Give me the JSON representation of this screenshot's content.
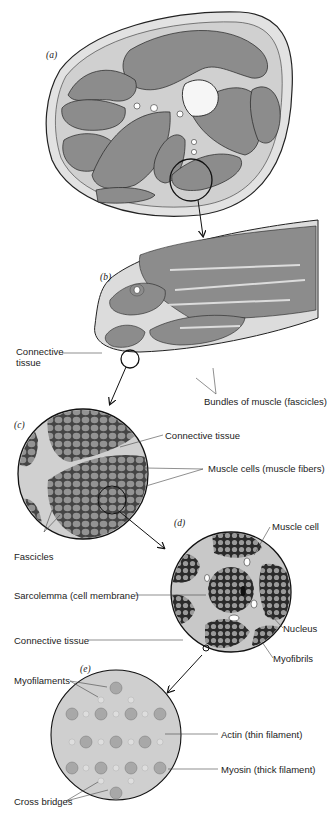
{
  "figure": {
    "panels": [
      {
        "id": "a",
        "label": "(a)",
        "content": "Cross-section of limb muscles"
      },
      {
        "id": "b",
        "label": "(b)",
        "content": "Single muscle cross-section"
      },
      {
        "id": "c",
        "label": "(c)",
        "content": "Fascicles"
      },
      {
        "id": "d",
        "label": "(d)",
        "content": "Muscle cell"
      },
      {
        "id": "e",
        "label": "(e)",
        "content": "Myofilaments lattice"
      }
    ],
    "labels": {
      "connective_tissue_b": "Connective\ntissue",
      "connective_tissue_b_line1": "Connective",
      "connective_tissue_b_line2": "tissue",
      "bundles": "Bundles of muscle (fascicles)",
      "connective_tissue_c": "Connective tissue",
      "muscle_cells": "Muscle cells (muscle fibers)",
      "fascicles": "Fascicles",
      "muscle_cell": "Muscle cell",
      "sarcolemma": "Sarcolemma (cell membrane)",
      "connective_tissue_d": "Connective tissue",
      "nucleus": "Nucleus",
      "myofibrils": "Myofibrils",
      "myofilaments": "Myofilaments",
      "actin": "Actin (thin filament)",
      "myosin": "Myosin (thick filament)",
      "cross_bridges": "Cross bridges"
    },
    "colors": {
      "muscle": "#8c8c8c",
      "connective": "#d6d6d6",
      "outline": "#1a1a1a",
      "background": "#ffffff"
    }
  }
}
